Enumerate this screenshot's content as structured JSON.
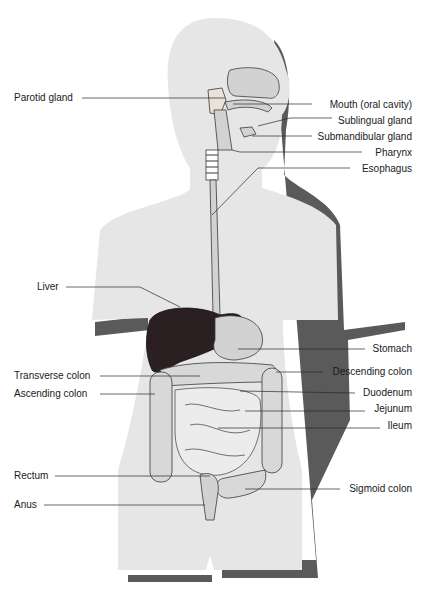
{
  "diagram": {
    "colors": {
      "body": "#e6e6e6",
      "shadow": "#5a5a5a",
      "organ_fill": "#d2d2d2",
      "organ_stroke": "#3a3a3a",
      "liver": "#2b1f22",
      "leader_line": "#2a2a2a",
      "text": "#1a1a1a"
    },
    "labels_left": [
      {
        "id": "parotid",
        "text": "Parotid gland"
      },
      {
        "id": "liver",
        "text": "Liver"
      },
      {
        "id": "transverse",
        "text": "Transverse colon"
      },
      {
        "id": "ascending",
        "text": "Ascending colon"
      },
      {
        "id": "rectum",
        "text": "Rectum"
      },
      {
        "id": "anus",
        "text": "Anus"
      }
    ],
    "labels_right": [
      {
        "id": "mouth",
        "text": "Mouth (oral cavity)"
      },
      {
        "id": "sublingual",
        "text": "Sublingual gland"
      },
      {
        "id": "submandibular",
        "text": "Submandibular gland"
      },
      {
        "id": "pharynx",
        "text": "Pharynx"
      },
      {
        "id": "esophagus",
        "text": "Esophagus"
      },
      {
        "id": "stomach",
        "text": "Stomach"
      },
      {
        "id": "descending",
        "text": "Descending colon"
      },
      {
        "id": "duodenum",
        "text": "Duodenum"
      },
      {
        "id": "jejunum",
        "text": "Jejunum"
      },
      {
        "id": "ileum",
        "text": "Ileum"
      },
      {
        "id": "sigmoid",
        "text": "Sigmoid colon"
      }
    ]
  }
}
